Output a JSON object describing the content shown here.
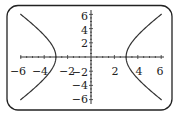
{
  "diagram": {
    "type": "graph",
    "equation_hint": "x^2/9 - y^2/12 = 1",
    "vertices": [
      [
        -3,
        0
      ],
      [
        3,
        0
      ]
    ],
    "x_axis": {
      "range": [
        -6,
        6
      ],
      "tick_labels": [
        "−6",
        "−4",
        "−2",
        "2",
        "4",
        "6"
      ],
      "tick_values": [
        -6,
        -4,
        -2,
        2,
        4,
        6
      ]
    },
    "y_axis": {
      "range": [
        -6,
        6
      ],
      "tick_labels": [
        "6",
        "4",
        "2",
        "−2",
        "−4",
        "−6"
      ],
      "tick_values": [
        6,
        4,
        2,
        -2,
        -4,
        -6
      ]
    },
    "colors": {
      "frame": "#222222",
      "curve": "#333333",
      "background": "#ffffff"
    }
  }
}
